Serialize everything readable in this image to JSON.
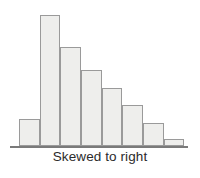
{
  "figure": {
    "caption": "Skewed to right",
    "background_color": "#ffffff"
  },
  "chart_data": {
    "type": "bar",
    "title": "Skewed to right",
    "subtitle": "",
    "xlabel": "Skewed to right",
    "ylabel": "",
    "categories": [
      "1",
      "2",
      "3",
      "4",
      "5",
      "6",
      "7",
      "8"
    ],
    "values": [
      27,
      131,
      99,
      76,
      58,
      41,
      23,
      7
    ],
    "ylim": [
      0,
      135
    ],
    "xlim": [
      0,
      8
    ],
    "grid": false,
    "legend": null,
    "axis": {
      "x_axis_visible": true,
      "y_axis_visible": false,
      "tick_labels_visible": false
    },
    "style": {
      "bar_fill": "#eeeeec",
      "bar_stroke": "#9a9a9a",
      "bar_stroke_width": 1,
      "axis_color": "#7a7a7a",
      "bar_gap": 0
    },
    "annotations": [
      {
        "text": "Skewed to right",
        "position": "below-axis-center"
      }
    ]
  }
}
